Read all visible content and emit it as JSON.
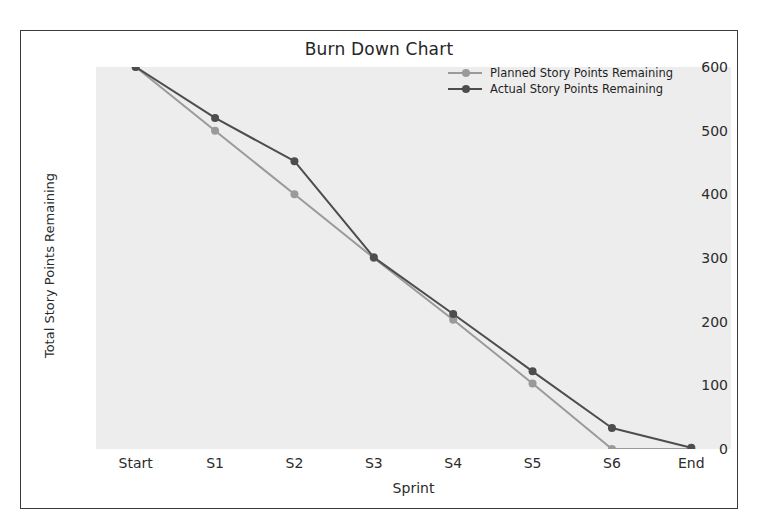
{
  "chart_data": {
    "type": "line",
    "title": "Burn Down Chart",
    "xlabel": "Sprint",
    "ylabel": "Total Story Points Remaining",
    "categories": [
      "Start",
      "S1",
      "S2",
      "S3",
      "S4",
      "S5",
      "S6",
      "End"
    ],
    "series": [
      {
        "name": "Planned Story Points Remaining",
        "values": [
          600,
          500,
          400,
          300,
          203,
          103,
          0,
          0
        ],
        "color": "#9a9a9a",
        "marker": "circle"
      },
      {
        "name": "Actual Story Points Remaining",
        "values": [
          600,
          520,
          452,
          301,
          212,
          122,
          33,
          2
        ],
        "color": "#4d4d4d",
        "marker": "circle"
      }
    ],
    "ylim": [
      0,
      600
    ],
    "yticks": [
      0,
      100,
      200,
      300,
      400,
      500,
      600
    ],
    "ytick_labels": [
      "0",
      "100",
      "200",
      "300",
      "400",
      "500",
      "600"
    ],
    "grid": false,
    "legend_position": "upper right",
    "plot_background": "#ededed",
    "figure_background": "#ffffff",
    "frame_color": "#3a3a3a"
  }
}
